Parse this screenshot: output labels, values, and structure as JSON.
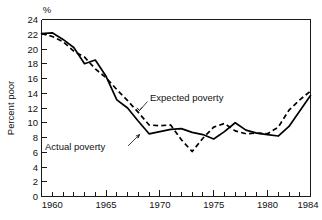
{
  "chart_data": {
    "type": "line",
    "title": "",
    "subtitle": "",
    "xlabel": "",
    "ylabel": "Percent poor",
    "unit_label": "%",
    "xlim": [
      1959,
      1984
    ],
    "ylim": [
      0,
      24
    ],
    "grid": false,
    "legend_position": "inline-annotations",
    "y_ticks": [
      0,
      2,
      4,
      6,
      8,
      10,
      12,
      14,
      16,
      18,
      20,
      22,
      24
    ],
    "y_tick_labels": [
      "0",
      "2",
      "4",
      "6",
      "8",
      "10",
      "12",
      "14",
      "16",
      "18",
      "20",
      "22",
      "24"
    ],
    "x_ticks": [
      1959,
      1960,
      1961,
      1962,
      1963,
      1964,
      1965,
      1966,
      1967,
      1968,
      1969,
      1970,
      1971,
      1972,
      1973,
      1974,
      1975,
      1976,
      1977,
      1978,
      1979,
      1980,
      1981,
      1982,
      1983,
      1984
    ],
    "x_tick_labels": [
      "1960",
      "1965",
      "1970",
      "1975",
      "1980",
      "1984"
    ],
    "x_labeled_ticks": [
      1960,
      1965,
      1970,
      1975,
      1980,
      1984
    ],
    "x": [
      1959,
      1960,
      1961,
      1962,
      1963,
      1964,
      1965,
      1966,
      1967,
      1968,
      1969,
      1970,
      1971,
      1972,
      1973,
      1974,
      1975,
      1976,
      1977,
      1978,
      1979,
      1980,
      1981,
      1982,
      1983,
      1984
    ],
    "series": [
      {
        "name": "Actual poverty",
        "style": "solid",
        "values": [
          22.1,
          22.2,
          21.3,
          20.2,
          18.0,
          18.5,
          16.3,
          13.1,
          12.0,
          10.2,
          8.5,
          8.8,
          9.1,
          9.2,
          8.7,
          8.4,
          7.8,
          8.8,
          10.0,
          9.0,
          8.6,
          8.4,
          8.2,
          9.5,
          11.6,
          13.7
        ],
        "annotation": "Actual poverty"
      },
      {
        "name": "Expected poverty",
        "style": "dashed",
        "values": [
          22.1,
          21.7,
          21.0,
          19.7,
          18.9,
          17.3,
          16.1,
          14.5,
          13.0,
          11.4,
          9.7,
          9.6,
          9.7,
          7.7,
          6.1,
          7.9,
          9.4,
          9.9,
          8.9,
          8.5,
          8.6,
          8.5,
          9.4,
          11.7,
          13.1,
          14.3
        ],
        "annotation": "Expected poverty"
      }
    ],
    "annotations": [
      {
        "text": "Expected poverty",
        "x_pos": 1970.3,
        "y_pos": 12.3
      },
      {
        "text": "Actual poverty",
        "x_pos": 1961.2,
        "y_pos": 6.5
      }
    ],
    "colors": {
      "line": "#000000",
      "axis": "#1a1a1a",
      "text": "#111111",
      "background": "#ffffff"
    }
  }
}
